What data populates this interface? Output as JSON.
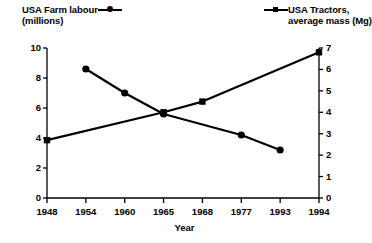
{
  "chart_data": {
    "type": "line",
    "title": "",
    "xlabel": "Year",
    "categories": [
      "1948",
      "1954",
      "1960",
      "1965",
      "1968",
      "1977",
      "1993",
      "1994"
    ],
    "grid": false,
    "legend_position": "top",
    "series": [
      {
        "name": "USA Farm labour (millions)",
        "name_line1": "USA Farm labour",
        "name_line2": "(millions)",
        "marker": "circle",
        "axis": "left",
        "x": [
          "1954",
          "1960",
          "1965",
          "1977",
          "1993"
        ],
        "values": [
          8.6,
          7.0,
          5.6,
          4.2,
          3.2
        ]
      },
      {
        "name": "USA Tractors, average mass (Mg)",
        "name_line1": "USA Tractors,",
        "name_line2": "average mass (Mg)",
        "marker": "square",
        "axis": "right",
        "x": [
          "1948",
          "1965",
          "1968",
          "1994"
        ],
        "values": [
          2.7,
          4.0,
          4.5,
          6.8
        ]
      }
    ],
    "y_left": {
      "label": "USA Farm labour (millions)",
      "ticks": [
        "0",
        "2",
        "4",
        "6",
        "8",
        "10"
      ],
      "ylim": [
        0,
        10
      ]
    },
    "y_right": {
      "label": "USA Tractors, average mass (Mg)",
      "ticks": [
        "0",
        "1",
        "2",
        "3",
        "4",
        "5",
        "6",
        "7"
      ],
      "ylim": [
        0,
        7
      ]
    },
    "colors": {
      "ink": "#000000",
      "background": "#ffffff"
    }
  }
}
